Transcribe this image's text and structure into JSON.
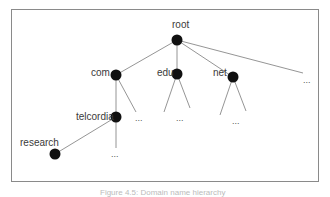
{
  "diagram": {
    "type": "tree",
    "title": "Domain name hierarchy",
    "nodes": [
      {
        "id": "root",
        "label": "root"
      },
      {
        "id": "com",
        "label": "com"
      },
      {
        "id": "edu",
        "label": "edu"
      },
      {
        "id": "net",
        "label": "net"
      },
      {
        "id": "telcordia",
        "label": "telcordia"
      },
      {
        "id": "research",
        "label": "research"
      }
    ],
    "ellipsis": "..."
  },
  "caption": "Figure 4.5: Domain name hierarchy"
}
